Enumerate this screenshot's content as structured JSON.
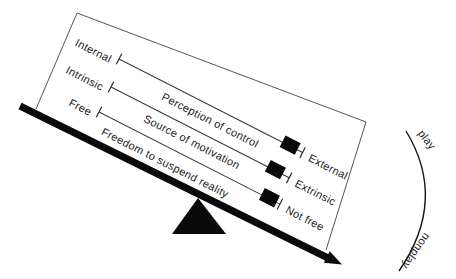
{
  "colors": {
    "ink": "#111111",
    "background": "#ffffff",
    "slider_fill": "#0a0a0a"
  },
  "scales": [
    {
      "left_label": "Internal",
      "title": "Perception of control",
      "right_label": "External",
      "slider_position": 0.93
    },
    {
      "left_label": "Intrinsic",
      "title": "Source of motivation",
      "right_label": "Extrinsic",
      "slider_position": 0.92
    },
    {
      "left_label": "Free",
      "title": "Freedom to suspend reality",
      "right_label": "Not free",
      "slider_position": 0.94
    }
  ],
  "gauge": {
    "play_label": "play",
    "nonplay_label": "nonplay"
  }
}
